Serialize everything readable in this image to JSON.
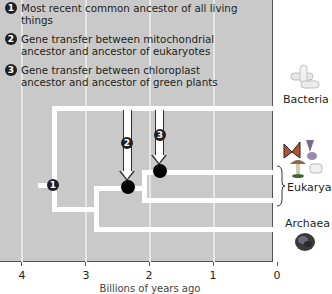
{
  "legend": {
    "items": [
      {
        "num": "1",
        "text": "Most recent common ancestor of all living things"
      },
      {
        "num": "2",
        "text": "Gene transfer between mitochondrial ancestor and ancestor of eukaryotes"
      },
      {
        "num": "3",
        "text": "Gene transfer between chloroplast ancestor and ancestor of green plants"
      }
    ]
  },
  "markers": {
    "m1": "1",
    "m2": "2",
    "m3": "3"
  },
  "taxa": {
    "bacteria": "Bacteria",
    "eukarya": "Eukarya",
    "archaea": "Archaea"
  },
  "axis": {
    "ticks": [
      "4",
      "3",
      "2",
      "1",
      "0"
    ],
    "label": "Billions of years ago"
  },
  "colors": {
    "panel": "#c9c9c9",
    "branch": "#ffffff",
    "node": "#000000"
  }
}
